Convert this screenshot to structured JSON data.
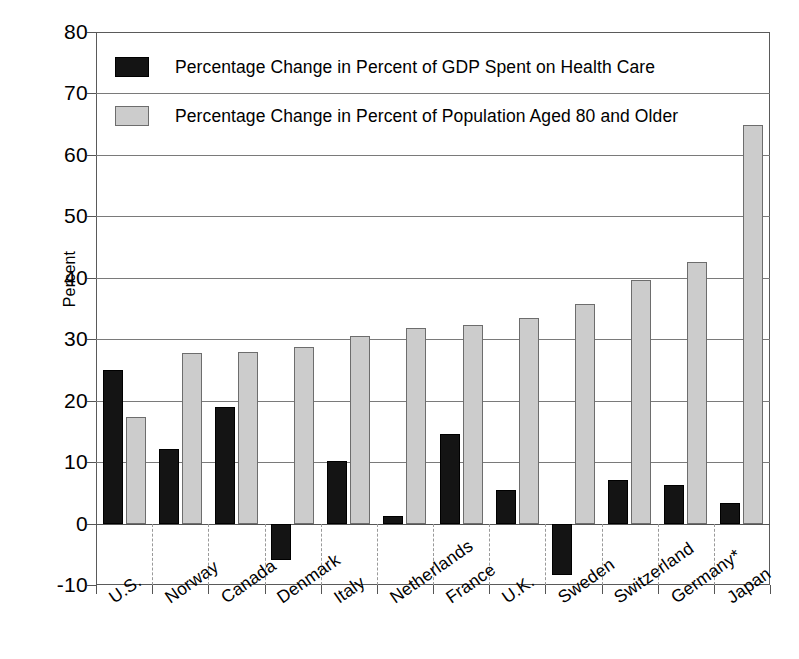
{
  "chart_data": {
    "type": "bar",
    "title": "",
    "subtitle": "",
    "xlabel": "",
    "ylabel": "Percent",
    "ylim": [
      -10,
      80
    ],
    "ytick_step": 10,
    "yticks": [
      80,
      70,
      60,
      50,
      40,
      30,
      20,
      10,
      0,
      -10
    ],
    "ytick_labels": [
      "80",
      "70",
      "60",
      "50",
      "40",
      "30",
      "20",
      "10",
      "0",
      "-10"
    ],
    "grid": true,
    "grid_axis": "y",
    "legend_position": "inside-top-left",
    "categories": [
      "U.S.",
      "Norway",
      "Canada",
      "Denmark",
      "Italy",
      "Netherlands",
      "France",
      "U.K.",
      "Sweden",
      "Switzerland",
      "Germany*",
      "Japan"
    ],
    "series": [
      {
        "name": "Percentage Change in Percent of GDP Spent on Health Care",
        "color": "#141414",
        "values": [
          25.0,
          12.1,
          19.0,
          -5.9,
          10.2,
          1.3,
          14.6,
          5.4,
          -8.3,
          7.1,
          6.3,
          3.4
        ]
      },
      {
        "name": "Percentage Change in Percent of Population Aged 80 and Older",
        "color": "#cccccc",
        "values": [
          17.4,
          27.8,
          28.0,
          28.7,
          30.5,
          31.9,
          32.3,
          33.5,
          35.8,
          39.6,
          42.6,
          64.8
        ]
      }
    ],
    "footnote": "*"
  },
  "legend": {
    "items": [
      {
        "label": "Percentage Change in Percent of GDP Spent on Health Care",
        "swatch": "dark-swatch"
      },
      {
        "label": "Percentage Change in Percent of Population Aged 80 and Older",
        "swatch": "light-swatch"
      }
    ]
  },
  "axes": {
    "y_title": "Percent"
  }
}
